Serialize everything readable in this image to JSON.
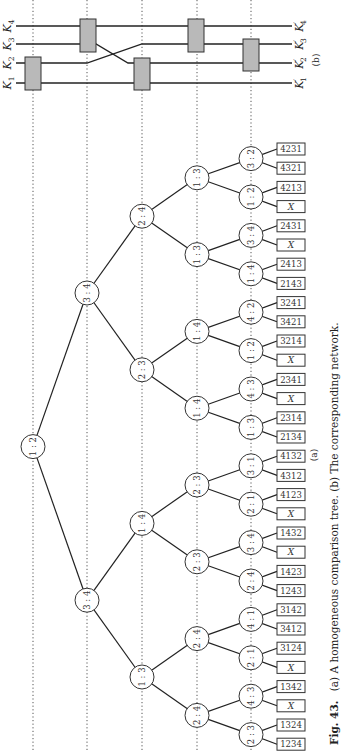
{
  "figure": {
    "orientation": "rotated-90-ccw",
    "caption": {
      "fig_label": "Fig. 43.",
      "text": "(a) A homogeneous comparison tree.  (b) The corresponding network."
    },
    "part_a_label": "(a)",
    "part_b_label": "(b)"
  },
  "network": {
    "inputs": [
      "K1",
      "K2",
      "K3",
      "K4"
    ],
    "outputs": [
      "K'1",
      "K'2",
      "K'3",
      "K'4"
    ],
    "input_labels": [
      {
        "main": "K",
        "sub": "1"
      },
      {
        "main": "K",
        "sub": "2"
      },
      {
        "main": "K",
        "sub": "3"
      },
      {
        "main": "K",
        "sub": "4"
      }
    ],
    "output_labels": [
      {
        "main": "K",
        "prime": "′",
        "sub": "1"
      },
      {
        "main": "K",
        "prime": "′",
        "sub": "2"
      },
      {
        "main": "K",
        "prime": "′",
        "sub": "3"
      },
      {
        "main": "K",
        "prime": "′",
        "sub": "4"
      }
    ],
    "comparators": [
      {
        "stage": 1,
        "lines": [
          "K1",
          "K2"
        ]
      },
      {
        "stage": 2,
        "lines": [
          "K3",
          "K4"
        ]
      },
      {
        "stage": 3,
        "lines": [
          "K1",
          "K2"
        ],
        "note": "after K2/K3 crossing"
      },
      {
        "stage": 4,
        "lines": [
          "K3",
          "K4"
        ]
      },
      {
        "stage": 5,
        "lines": [
          "K2",
          "K3"
        ]
      }
    ],
    "crossing": {
      "between_stages": [
        2,
        3
      ],
      "lines": [
        "K2",
        "K3"
      ]
    }
  },
  "tree": {
    "root": "1:2",
    "level1": [
      "3:4",
      "3:4"
    ],
    "level2": [
      "2:4",
      "2:3",
      "1:4",
      "1:3"
    ],
    "level3": [
      "1:3",
      "1:3",
      "1:4",
      "1:4",
      "2:3",
      "2:3",
      "2:4",
      "2:4"
    ],
    "level4": [
      "3:2",
      "1:2",
      "3:4",
      "1:4",
      "4:2",
      "1:2",
      "4:3",
      "1:3",
      "3:1",
      "2:1",
      "3:4",
      "2:4",
      "4:1",
      "2:1",
      "4:3",
      "2:3"
    ],
    "leaves": [
      "4231",
      "4321",
      "4213",
      "X",
      "2431",
      "X",
      "2413",
      "2143",
      "3241",
      "3421",
      "3214",
      "X",
      "2341",
      "X",
      "2314",
      "2134",
      "4132",
      "4312",
      "4123",
      "X",
      "1432",
      "X",
      "1423",
      "1243",
      "3142",
      "3412",
      "3124",
      "X",
      "1342",
      "X",
      "1324",
      "1234"
    ]
  }
}
